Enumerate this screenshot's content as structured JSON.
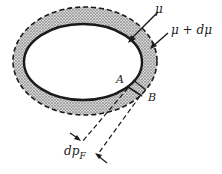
{
  "diagram": {
    "labels": {
      "mu": "μ",
      "mu_plus_dmu": "μ + dμ",
      "point_a": "A",
      "point_b": "B",
      "dp": "dp",
      "dp_sub": "F"
    },
    "colors": {
      "stroke": "#1a1a1a",
      "shell_fill": "#b8b8b8"
    }
  }
}
